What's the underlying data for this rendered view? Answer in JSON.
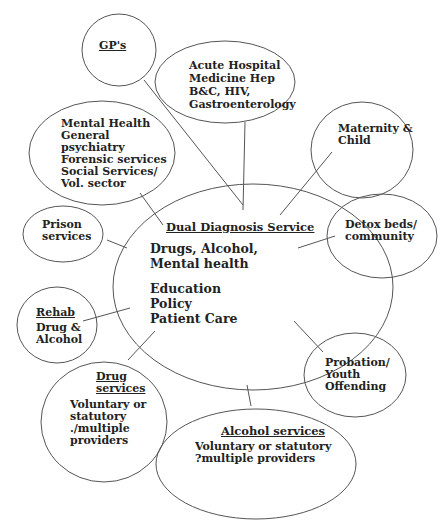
{
  "diagram": {
    "title": "Dual Diagnosis Service",
    "center": {
      "title": "Dual Diagnosis Service",
      "lines_group1": [
        "Drugs, Alcohol,",
        "Mental health"
      ],
      "lines_group2": [
        "Education",
        "Policy",
        "Patient Care"
      ]
    },
    "nodes": [
      {
        "id": "gps",
        "title": "GP's",
        "lines": []
      },
      {
        "id": "acute",
        "title": "",
        "lines": [
          "Acute Hospital",
          "Medicine Hep",
          "B&C, HIV,",
          "Gastroenterology"
        ]
      },
      {
        "id": "maternity",
        "title": "",
        "lines": [
          "Maternity &",
          "Child"
        ]
      },
      {
        "id": "mental",
        "title": "",
        "lines": [
          "Mental Health",
          "General",
          "psychiatry",
          "Forensic services",
          "Social Services/",
          "Vol. sector"
        ]
      },
      {
        "id": "prison",
        "title": "",
        "lines": [
          "Prison",
          "services"
        ]
      },
      {
        "id": "detox",
        "title": "",
        "lines": [
          "Detox beds/",
          "community"
        ]
      },
      {
        "id": "rehab",
        "title": "Rehab",
        "lines": [
          "Drug &",
          "Alcohol"
        ]
      },
      {
        "id": "probation",
        "title": "",
        "lines": [
          "Probation/",
          "Youth",
          "Offending"
        ]
      },
      {
        "id": "drug",
        "title_lines": [
          "Drug",
          "services"
        ],
        "lines": [
          "Voluntary or",
          "statutory",
          "./multiple",
          "providers"
        ]
      },
      {
        "id": "alcohol",
        "title": "Alcohol services",
        "lines": [
          "Voluntary or statutory",
          "?multiple providers"
        ]
      }
    ],
    "stroke_color": "#555555",
    "text_color": "#222222"
  }
}
